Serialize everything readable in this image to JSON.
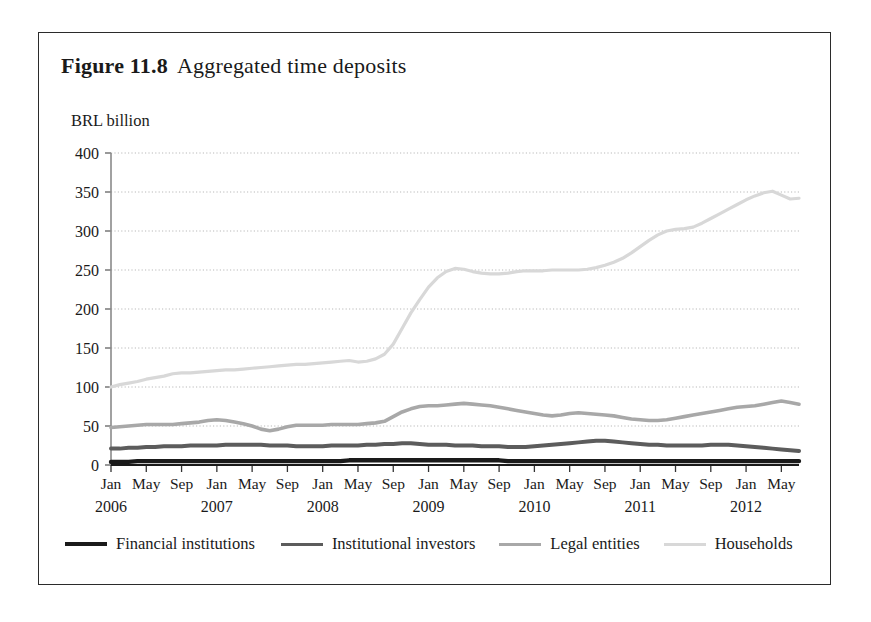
{
  "figure": {
    "label": "Figure 11.8",
    "caption": "Aggregated time deposits"
  },
  "axis_unit": "BRL billion",
  "legend": {
    "items": [
      {
        "label": "Financial institutions",
        "color": "#1a1a1a",
        "width": 4.2
      },
      {
        "label": "Institutional investors",
        "color": "#5c5c5c",
        "width": 3.6
      },
      {
        "label": "Legal entities",
        "color": "#a8a8a8",
        "width": 3.2
      },
      {
        "label": "Households",
        "color": "#d8d8d8",
        "width": 3.0
      }
    ]
  },
  "chart_data": {
    "type": "line",
    "title": "Aggregated time deposits",
    "xlabel": "",
    "ylabel": "BRL billion",
    "ylim": [
      0,
      400
    ],
    "yticks": [
      0,
      50,
      100,
      150,
      200,
      250,
      300,
      350,
      400
    ],
    "grid": true,
    "legend_position": "bottom",
    "x_month_labels": [
      "Jan",
      "May",
      "Sep",
      "Jan",
      "May",
      "Sep",
      "Jan",
      "May",
      "Sep",
      "Jan",
      "May",
      "Sep",
      "Jan",
      "May",
      "Sep",
      "Jan",
      "May",
      "Sep",
      "Jan",
      "May"
    ],
    "x_year_labels": [
      "2006",
      "2007",
      "2008",
      "2009",
      "2010",
      "2011",
      "2012"
    ],
    "x_start": "2006-01",
    "x_end": "2012-07",
    "x_points": 79,
    "series": [
      {
        "name": "Financial institutions",
        "color": "#1a1a1a",
        "values": [
          4,
          4,
          4,
          5,
          5,
          5,
          5,
          5,
          5,
          5,
          5,
          5,
          5,
          5,
          5,
          5,
          5,
          5,
          5,
          5,
          5,
          5,
          5,
          5,
          5,
          5,
          5,
          6,
          6,
          6,
          6,
          6,
          6,
          6,
          6,
          6,
          6,
          6,
          6,
          6,
          6,
          6,
          6,
          6,
          6,
          5,
          5,
          5,
          5,
          5,
          5,
          5,
          5,
          5,
          5,
          5,
          5,
          5,
          5,
          5,
          5,
          5,
          5,
          5,
          5,
          5,
          5,
          5,
          5,
          5,
          5,
          5,
          5,
          5,
          5,
          5,
          5,
          5,
          5
        ]
      },
      {
        "name": "Institutional investors",
        "color": "#5c5c5c",
        "values": [
          21,
          21,
          22,
          22,
          23,
          23,
          24,
          24,
          24,
          25,
          25,
          25,
          25,
          26,
          26,
          26,
          26,
          26,
          25,
          25,
          25,
          24,
          24,
          24,
          24,
          25,
          25,
          25,
          25,
          26,
          26,
          27,
          27,
          28,
          28,
          27,
          26,
          26,
          26,
          25,
          25,
          25,
          24,
          24,
          24,
          23,
          23,
          23,
          24,
          25,
          26,
          27,
          28,
          29,
          30,
          31,
          31,
          30,
          29,
          28,
          27,
          26,
          26,
          25,
          25,
          25,
          25,
          25,
          26,
          26,
          26,
          25,
          24,
          23,
          22,
          21,
          20,
          19,
          18
        ]
      },
      {
        "name": "Legal entities",
        "color": "#a8a8a8",
        "values": [
          48,
          49,
          50,
          51,
          52,
          52,
          52,
          52,
          53,
          54,
          55,
          57,
          58,
          57,
          55,
          53,
          50,
          46,
          44,
          46,
          49,
          51,
          51,
          51,
          51,
          52,
          52,
          52,
          52,
          53,
          54,
          56,
          62,
          68,
          72,
          75,
          76,
          76,
          77,
          78,
          79,
          78,
          77,
          76,
          74,
          72,
          70,
          68,
          66,
          64,
          63,
          64,
          66,
          67,
          66,
          65,
          64,
          63,
          61,
          59,
          58,
          57,
          57,
          58,
          60,
          62,
          64,
          66,
          68,
          70,
          72,
          74,
          75,
          76,
          78,
          80,
          82,
          80,
          78
        ]
      },
      {
        "name": "Households",
        "color": "#d8d8d8",
        "values": [
          100,
          103,
          105,
          107,
          110,
          112,
          114,
          117,
          118,
          118,
          119,
          120,
          121,
          122,
          122,
          123,
          124,
          125,
          126,
          127,
          128,
          129,
          129,
          130,
          131,
          132,
          133,
          134,
          132,
          133,
          136,
          142,
          155,
          175,
          195,
          212,
          228,
          240,
          248,
          252,
          251,
          248,
          246,
          245,
          245,
          246,
          248,
          249,
          249,
          249,
          250,
          250,
          250,
          250,
          251,
          253,
          256,
          260,
          265,
          272,
          280,
          288,
          295,
          300,
          302,
          303,
          305,
          310,
          316,
          322,
          328,
          334,
          340,
          345,
          349,
          351,
          346,
          341,
          342
        ]
      }
    ]
  }
}
